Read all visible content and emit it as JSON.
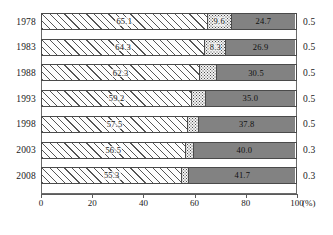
{
  "chart_data": {
    "type": "bar",
    "orientation": "horizontal",
    "stacked": true,
    "title": "",
    "xlabel": "(%)",
    "ylabel": "",
    "xlim": [
      0,
      100
    ],
    "grid": false,
    "legend_position": "none",
    "categories": [
      "1978",
      "1983",
      "1988",
      "1993",
      "1998",
      "2003",
      "2008"
    ],
    "tick_labels": [
      "0",
      "20",
      "40",
      "60",
      "80",
      "100"
    ],
    "tick_values": [
      0,
      20,
      40,
      60,
      80,
      100
    ],
    "unit": "(%)",
    "series": [
      {
        "name": "hatched",
        "pattern": "diagonal-hatch",
        "values": [
          65.1,
          64.3,
          62.3,
          59.2,
          57.5,
          56.5,
          55.3
        ],
        "labels": [
          "65.1",
          "64.3",
          "62.3",
          "59.2",
          "57.5",
          "56.5",
          "55.3"
        ]
      },
      {
        "name": "dotted",
        "pattern": "dotted",
        "values": [
          9.6,
          8.3,
          6.7,
          5.3,
          4.2,
          3.2,
          2.7
        ],
        "labels": [
          "9.6",
          "8.3",
          "",
          "",
          "",
          "",
          ""
        ]
      },
      {
        "name": "solid-gray",
        "pattern": "solid",
        "values": [
          24.7,
          26.9,
          30.5,
          35.0,
          37.8,
          40.0,
          41.7
        ],
        "labels": [
          "24.7",
          "26.9",
          "30.5",
          "35.0",
          "37.8",
          "40.0",
          "41.7"
        ]
      },
      {
        "name": "remainder",
        "pattern": "white",
        "values": [
          0.5,
          0.5,
          0.5,
          0.5,
          0.5,
          0.3,
          0.3
        ],
        "labels": [
          "0.5",
          "0.5",
          "0.5",
          "0.5",
          "0.5",
          "0.3",
          "0.3"
        ],
        "labels_outside": true
      }
    ],
    "colors": {
      "hatch_fill": "#fdfdfd",
      "hatch_line": "#555555",
      "dot_fill": "#f2f2f2",
      "dot_mark": "#4d4d4d",
      "solid_fill": "#828282",
      "frame": "#6b6b6b",
      "text": "#1a1a1a"
    }
  },
  "axis": {
    "unit_label": "(%)",
    "ticks": [
      {
        "label": "0",
        "value": 0
      },
      {
        "label": "20",
        "value": 20
      },
      {
        "label": "40",
        "value": 40
      },
      {
        "label": "60",
        "value": 60
      },
      {
        "label": "80",
        "value": 80
      },
      {
        "label": "100",
        "value": 100
      }
    ]
  },
  "rows": [
    {
      "year": "1978",
      "hatch": "65.1",
      "dot": "9.6",
      "solid": "24.7",
      "right": "0.5"
    },
    {
      "year": "1983",
      "hatch": "64.3",
      "dot": "8.3",
      "solid": "26.9",
      "right": "0.5"
    },
    {
      "year": "1988",
      "hatch": "62.3",
      "dot": "",
      "solid": "30.5",
      "right": "0.5"
    },
    {
      "year": "1993",
      "hatch": "59.2",
      "dot": "",
      "solid": "35.0",
      "right": "0.5"
    },
    {
      "year": "1998",
      "hatch": "57.5",
      "dot": "",
      "solid": "37.8",
      "right": "0.5"
    },
    {
      "year": "2003",
      "hatch": "56.5",
      "dot": "",
      "solid": "40.0",
      "right": "0.3"
    },
    {
      "year": "2008",
      "hatch": "55.3",
      "dot": "",
      "solid": "41.7",
      "right": "0.3"
    }
  ],
  "caption": {
    "text": ""
  }
}
